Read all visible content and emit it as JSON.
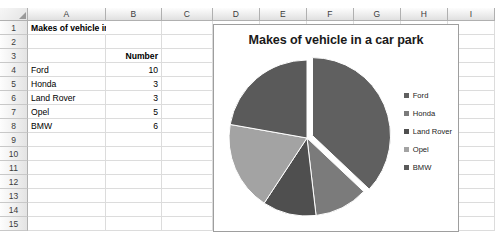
{
  "spreadsheet": {
    "columns": [
      "A",
      "B",
      "C",
      "D",
      "E",
      "F",
      "G",
      "H",
      "I"
    ],
    "column_widths": [
      78,
      56,
      51,
      47,
      47,
      47,
      47,
      47,
      47
    ],
    "rows": [
      "1",
      "2",
      "3",
      "4",
      "5",
      "6",
      "7",
      "8",
      "9",
      "10",
      "11",
      "12",
      "13",
      "14",
      "15"
    ],
    "cells": {
      "A1": "Makes of vehicle in a car park",
      "B3": "Number",
      "A4": "Ford",
      "B4": "10",
      "A5": "Honda",
      "B5": "3",
      "A6": "Land Rover",
      "B6": "3",
      "A7": "Opel",
      "B7": "5",
      "A8": "BMW",
      "B8": "6"
    }
  },
  "chart_data": {
    "type": "pie",
    "title": "Makes of vehicle in a car park",
    "categories": [
      "Ford",
      "Honda",
      "Land Rover",
      "Opel",
      "BMW"
    ],
    "values": [
      10,
      3,
      3,
      5,
      6
    ],
    "total": 27,
    "colors": [
      "#606060",
      "#7b7b7b",
      "#4f4f4f",
      "#a3a3a3",
      "#5a5a5a"
    ],
    "legend_position": "right",
    "exploded_slice": "Ford",
    "start_angle": 0,
    "grid": false,
    "xlabel": "",
    "ylabel": ""
  }
}
